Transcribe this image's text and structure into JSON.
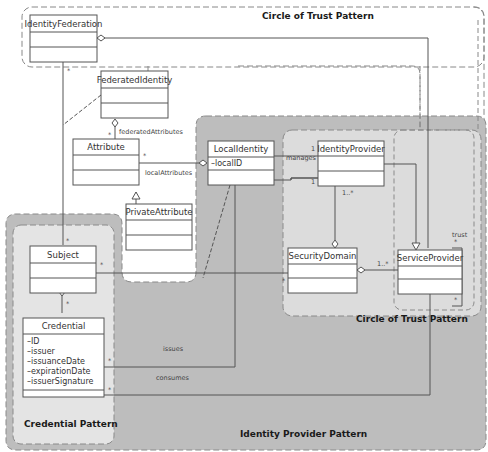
{
  "regions": {
    "circle_of_trust_top": {
      "title": "Circle of Trust Pattern"
    },
    "identity_provider": {
      "title": "Identity Provider Pattern"
    },
    "circle_of_trust_inner": {
      "title": "Circle of Trust Pattern"
    },
    "credential": {
      "title": "Credential Pattern"
    }
  },
  "classes": {
    "identity_federation": {
      "name": "IdentityFederation",
      "attributes": []
    },
    "federated_identity": {
      "name": "FederatedIdentity",
      "attributes": []
    },
    "attribute": {
      "name": "Attribute",
      "attributes": []
    },
    "private_attribute": {
      "name": "PrivateAttribute",
      "attributes": []
    },
    "local_identity": {
      "name": "LocalIdentity",
      "attributes": [
        "–localID"
      ]
    },
    "identity_provider": {
      "name": "IdentityProvider",
      "attributes": []
    },
    "subject": {
      "name": "Subject",
      "attributes": []
    },
    "security_domain": {
      "name": "SecurityDomain",
      "attributes": []
    },
    "service_provider": {
      "name": "ServiceProvider",
      "attributes": []
    },
    "credential": {
      "name": "Credential",
      "attributes": [
        "–ID",
        "–issuer",
        "–issuanceDate",
        "–expirationDate",
        "–issuerSignature"
      ]
    }
  },
  "associations": {
    "federated_attributes": "federatedAttributes",
    "local_attributes": "localAttributes",
    "manages": "manages",
    "trust": "trust",
    "issues": "issues",
    "consumes": "consumes"
  },
  "multiplicities": {
    "star": "*",
    "one": "1",
    "one_many": "1..*"
  },
  "colors": {
    "outer_gray": "#b9b9b9",
    "inner_gray": "#d9d9d9",
    "light_gray": "#e6e6e6",
    "line": "#555555",
    "box_fill": "#ffffff"
  }
}
